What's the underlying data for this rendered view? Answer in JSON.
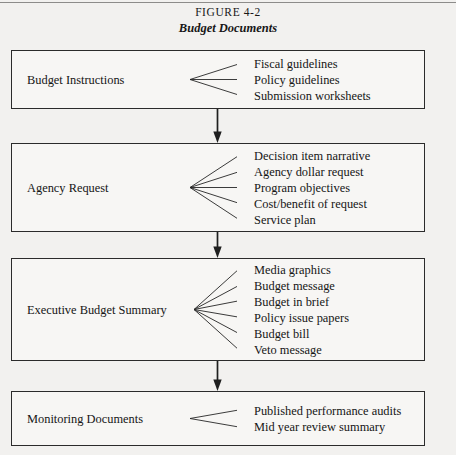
{
  "figure": {
    "number_label": "FIGURE 4-2",
    "title": "Budget Documents"
  },
  "flow": {
    "stages": [
      {
        "label": "Budget Instructions",
        "items": [
          "Fiscal guidelines",
          "Policy guidelines",
          "Submission worksheets"
        ]
      },
      {
        "label": "Agency Request",
        "items": [
          "Decision item narrative",
          "Agency dollar request",
          "Program objectives",
          "Cost/benefit of request",
          "Service plan"
        ]
      },
      {
        "label": "Executive Budget Summary",
        "items": [
          "Media graphics",
          "Budget message",
          "Budget in brief",
          "Policy issue papers",
          "Budget bill",
          "Veto message"
        ]
      },
      {
        "label": "Monitoring Documents",
        "items": [
          "Published performance audits",
          "Mid year review summary"
        ]
      }
    ],
    "connectors": [
      {
        "icon": "down-arrow-icon",
        "from": "Budget Instructions",
        "to": "Agency Request"
      },
      {
        "icon": "down-arrow-icon",
        "from": "Agency Request",
        "to": "Executive Budget Summary"
      },
      {
        "icon": "down-arrow-icon",
        "from": "Executive Budget Summary",
        "to": "Monitoring Documents"
      }
    ]
  },
  "colors": {
    "page_background": "#f2f1ef",
    "box_border": "#2b2b2b",
    "box_fill": "#f7f6f4",
    "text": "#151515",
    "rule": "#8d8c8a"
  }
}
